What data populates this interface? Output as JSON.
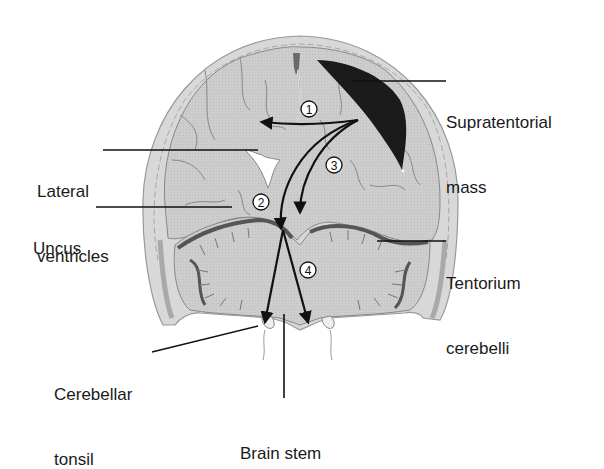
{
  "labels": {
    "supratentorial_mass": {
      "line1": "Supratentorial",
      "line2": "mass"
    },
    "lateral_ventricles": {
      "line1": "Lateral",
      "line2": "ventricles"
    },
    "uncus": {
      "line1": "Uncus"
    },
    "tentorium_cerebelli": {
      "line1": "Tentorium",
      "line2": "cerebelli"
    },
    "cerebellar_tonsil": {
      "line1": "Cerebellar",
      "line2": "tonsil"
    },
    "brain_stem": {
      "line1": "Brain stem"
    }
  },
  "herniation_markers": [
    {
      "id": "1",
      "label": "1"
    },
    {
      "id": "2",
      "label": "2"
    },
    {
      "id": "3",
      "label": "3"
    },
    {
      "id": "4",
      "label": "4"
    }
  ],
  "colors": {
    "skull": "#d4d4d4",
    "skull_edge": "#9a9a9a",
    "brain": "#cfcfcf",
    "sulci": "#7a7a7a",
    "tentorium": "#5a5a5a",
    "mass": "#1b1b1b",
    "ventricle": "#ffffff",
    "arrow": "#111111",
    "text": "#1a1a1a"
  }
}
